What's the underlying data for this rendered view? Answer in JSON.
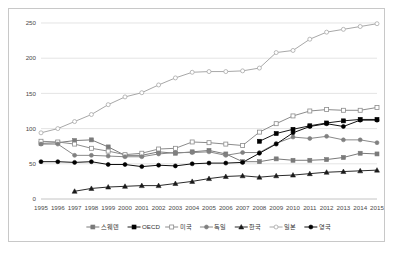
{
  "chart_data": {
    "type": "line",
    "title": "",
    "xlabel": "",
    "ylabel": "",
    "ylim": [
      0,
      250
    ],
    "yticks": [
      0,
      50,
      100,
      150,
      200,
      250
    ],
    "grid": true,
    "legend_position": "bottom",
    "x": [
      1995,
      1996,
      1997,
      1998,
      1999,
      2000,
      2001,
      2002,
      2003,
      2004,
      2005,
      2006,
      2007,
      2008,
      2009,
      2010,
      2011,
      2012,
      2013,
      2014,
      2015
    ],
    "categories": [
      "1995",
      "1996",
      "1997",
      "1998",
      "1999",
      "2000",
      "2001",
      "2002",
      "2003",
      "2004",
      "2005",
      "2006",
      "2007",
      "2008",
      "2009",
      "2010",
      "2011",
      "2012",
      "2013",
      "2014",
      "2015"
    ],
    "series": [
      {
        "name": "스웨덴",
        "marker": "filled-square",
        "color": "#7a7a7a",
        "marker_color": "#7a7a7a",
        "values": [
          79,
          80,
          83,
          84,
          74,
          62,
          62,
          67,
          65,
          67,
          69,
          64,
          53,
          53,
          57,
          55,
          55,
          56,
          59,
          65,
          64
        ]
      },
      {
        "name": "OECD",
        "marker": "filled-square",
        "color": "#1a1a1a",
        "marker_color": "#000000",
        "values": [
          null,
          null,
          null,
          null,
          null,
          null,
          null,
          null,
          null,
          null,
          null,
          null,
          null,
          82,
          93,
          99,
          104,
          108,
          111,
          113,
          113
        ]
      },
      {
        "name": "미국",
        "marker": "open-square",
        "color": "#8c8c8c",
        "marker_color": "#8c8c8c",
        "values": [
          82,
          81,
          78,
          72,
          68,
          63,
          65,
          71,
          72,
          81,
          80,
          78,
          76,
          95,
          107,
          118,
          125,
          127,
          126,
          126,
          130
        ]
      },
      {
        "name": "독일",
        "marker": "filled-circle",
        "color": "#888888",
        "marker_color": "#808080",
        "values": [
          78,
          78,
          62,
          62,
          61,
          60,
          60,
          64,
          66,
          66,
          67,
          62,
          66,
          66,
          79,
          88,
          86,
          89,
          84,
          84,
          80
        ]
      },
      {
        "name": "한국",
        "marker": "filled-triangle",
        "color": "#2b2b2b",
        "marker_color": "#1a1a1a",
        "values": [
          null,
          null,
          11,
          15,
          17,
          18,
          19,
          19,
          22,
          25,
          29,
          32,
          33,
          31,
          33,
          34,
          36,
          38,
          39,
          40,
          41
        ]
      },
      {
        "name": "일본",
        "marker": "open-circle",
        "color": "#a8a8a8",
        "marker_color": "#a8a8a8",
        "values": [
          94,
          100,
          110,
          120,
          134,
          145,
          151,
          162,
          172,
          180,
          181,
          181,
          182,
          186,
          208,
          211,
          227,
          237,
          241,
          245,
          249
        ]
      },
      {
        "name": "영국",
        "marker": "filled-circle",
        "color": "#111111",
        "marker_color": "#000000",
        "values": [
          53,
          53,
          52,
          53,
          49,
          49,
          46,
          48,
          47,
          50,
          51,
          51,
          52,
          65,
          78,
          94,
          103,
          107,
          103,
          112,
          112
        ]
      }
    ]
  },
  "legend": {
    "items": [
      {
        "label": "스웨덴"
      },
      {
        "label": "OECD"
      },
      {
        "label": "미국"
      },
      {
        "label": "독일"
      },
      {
        "label": "한국"
      },
      {
        "label": "일본"
      },
      {
        "label": "영국"
      }
    ]
  }
}
